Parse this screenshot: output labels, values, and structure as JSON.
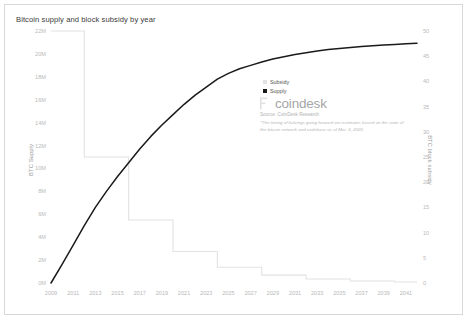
{
  "chart": {
    "title": "Bitcoin supply and block subsidy by year"
  },
  "axes": {
    "left": {
      "label": "BTC Supply",
      "ticks": [
        "0M",
        "2M",
        "4M",
        "6M",
        "8M",
        "10M",
        "12M",
        "14M",
        "16M",
        "18M",
        "20M",
        "22M"
      ]
    },
    "right": {
      "label": "BTC block subsidy",
      "ticks": [
        "0",
        "5",
        "10",
        "15",
        "20",
        "25",
        "30",
        "35",
        "40",
        "45",
        "50"
      ]
    },
    "bottom": {
      "ticks": [
        "2009",
        "2011",
        "2013",
        "2015",
        "2017",
        "2019",
        "2021",
        "2023",
        "2025",
        "2027",
        "2029",
        "2031",
        "2033",
        "2035",
        "2037",
        "2039",
        "2041"
      ]
    }
  },
  "legend": {
    "items": [
      {
        "label": "Subsidy",
        "color": "#e2e2e2"
      },
      {
        "label": "Supply",
        "color": "#1a1a1a"
      }
    ]
  },
  "branding": {
    "wordmark": "coindesk",
    "source": "Source: CoinDesk Research",
    "footnote": "*The timing of halvings going forward are estimates based on the state of the bitcoin network and codebase as of Mar. 3, 2020."
  },
  "chart_data": {
    "type": "line",
    "title": "Bitcoin supply and block subsidy by year",
    "xlabel": "",
    "ylabel": "BTC Supply",
    "y2label": "BTC block subsidy",
    "grid": false,
    "legend_position": "center-right",
    "xlim": [
      2009,
      2042
    ],
    "ylim": [
      0,
      22000000
    ],
    "y2lim": [
      0,
      50
    ],
    "x": [
      2009,
      2010,
      2011,
      2012,
      2013,
      2014,
      2015,
      2016,
      2017,
      2018,
      2019,
      2020,
      2021,
      2022,
      2023,
      2024,
      2025,
      2026,
      2027,
      2028,
      2029,
      2030,
      2031,
      2032,
      2033,
      2034,
      2035,
      2036,
      2037,
      2038,
      2039,
      2040,
      2041,
      2042
    ],
    "series": [
      {
        "name": "Supply",
        "axis": "left",
        "style": "line",
        "color": "#1a1a1a",
        "unit": "BTC",
        "values": [
          0,
          1625000,
          3300000,
          5000000,
          6600000,
          8000000,
          9300000,
          10500000,
          11700000,
          12800000,
          13800000,
          14700000,
          15600000,
          16400000,
          17100000,
          17800000,
          18300000,
          18700000,
          19000000,
          19300000,
          19550000,
          19750000,
          19950000,
          20100000,
          20250000,
          20380000,
          20480000,
          20570000,
          20650000,
          20720000,
          20780000,
          20830000,
          20880000,
          20920000
        ]
      },
      {
        "name": "Subsidy",
        "axis": "right",
        "style": "step",
        "color": "#e2e2e2",
        "unit": "BTC per block",
        "halvings": [
          {
            "year_start": 2009,
            "year_end": 2012,
            "subsidy": 50
          },
          {
            "year_start": 2012,
            "year_end": 2016,
            "subsidy": 25
          },
          {
            "year_start": 2016,
            "year_end": 2020,
            "subsidy": 12.5
          },
          {
            "year_start": 2020,
            "year_end": 2024,
            "subsidy": 6.25
          },
          {
            "year_start": 2024,
            "year_end": 2028,
            "subsidy": 3.125
          },
          {
            "year_start": 2028,
            "year_end": 2032,
            "subsidy": 1.5625
          },
          {
            "year_start": 2032,
            "year_end": 2036,
            "subsidy": 0.78125
          },
          {
            "year_start": 2036,
            "year_end": 2040,
            "subsidy": 0.390625
          },
          {
            "year_start": 2040,
            "year_end": 2042,
            "subsidy": 0.1953125
          }
        ]
      }
    ],
    "annotations": [
      "*The timing of halvings going forward are estimates based on the state of the bitcoin network and codebase as of Mar. 3, 2020."
    ]
  }
}
